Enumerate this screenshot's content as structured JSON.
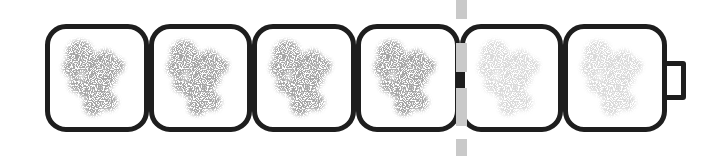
{
  "figure": {
    "kind": "film-strip-battery-indicator",
    "cell_count": 6,
    "filled_count": 4,
    "cells": [
      {
        "state": "filled"
      },
      {
        "state": "filled"
      },
      {
        "state": "filled"
      },
      {
        "state": "filled"
      },
      {
        "state": "empty"
      },
      {
        "state": "empty"
      }
    ],
    "marker": {
      "position": "between cell 4 and cell 5",
      "style": "vertical dashed bar"
    },
    "terminal": {
      "side": "right"
    },
    "colors": {
      "outline": "#1e1e1e",
      "filled_blob": "#a2a2a2",
      "empty_blob": "#d9d9d9",
      "marker": "#c9c9c9",
      "background": "#ffffff"
    }
  }
}
